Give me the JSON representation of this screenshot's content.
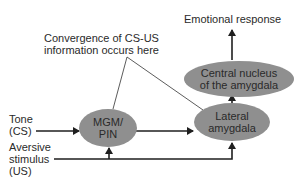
{
  "diagram": {
    "type": "flow",
    "colors": {
      "node_fill": "#8f8f8f",
      "line": "#1f1f1f",
      "annotation_line": "#4a4a4a",
      "text": "#2a2a2a"
    },
    "annotation": {
      "line1": "Convergence of CS-US",
      "line2": "information occurs here"
    },
    "output": {
      "label": "Emotional response"
    },
    "nodes": {
      "central": {
        "line1": "Central nucleus",
        "line2": "of the amygdala"
      },
      "lateral": {
        "line1": "Lateral",
        "line2": "amygdala"
      },
      "mgm": {
        "line1": "MGM/",
        "line2": "PIN"
      }
    },
    "inputs": {
      "tone": {
        "line1": "Tone",
        "line2": "(CS)"
      },
      "aversive": {
        "line1": "Aversive",
        "line2": "stimulus",
        "line3": "(US)"
      }
    },
    "edges": [
      {
        "from": "Tone (CS)",
        "to": "MGM/PIN"
      },
      {
        "from": "MGM/PIN",
        "to": "Lateral amygdala"
      },
      {
        "from": "Aversive stimulus (US)",
        "to": "MGM/PIN"
      },
      {
        "from": "Aversive stimulus (US)",
        "to": "Lateral amygdala"
      },
      {
        "from": "Lateral amygdala",
        "to": "Central nucleus of the amygdala"
      },
      {
        "from": "Central nucleus of the amygdala",
        "to": "Emotional response"
      }
    ]
  }
}
